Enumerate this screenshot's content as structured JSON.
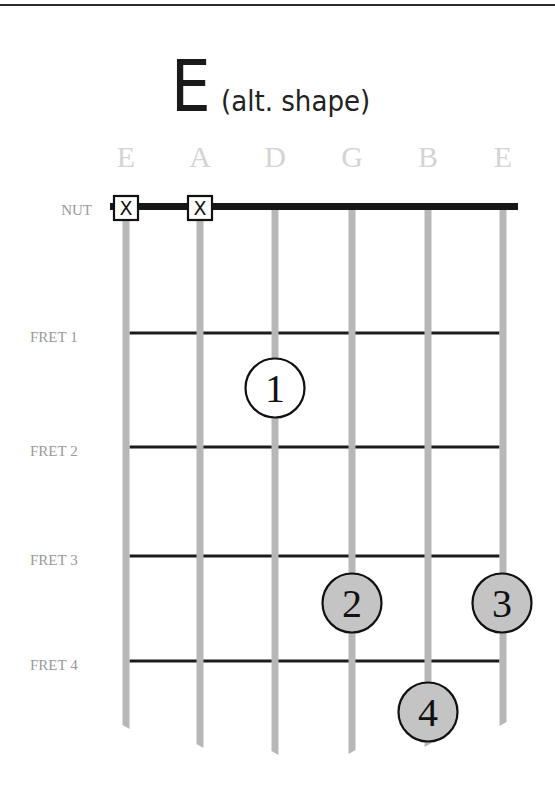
{
  "title": {
    "chord": "E",
    "variant": "(alt. shape)"
  },
  "nut_label": "NUT",
  "colors": {
    "string": "#b7b7b7",
    "fret": "#1c1c1c",
    "nut": "#161616",
    "string_label": "#d4d4d4",
    "fret_label": "#9a9a9a",
    "dot_open_fill": "#ffffff",
    "dot_filled_fill": "#c4c4c4",
    "dot_border": "#111111"
  },
  "strings": [
    {
      "name": "E",
      "x": 126,
      "end_y": 727,
      "muted": true
    },
    {
      "name": "A",
      "x": 200,
      "end_y": 746,
      "muted": true
    },
    {
      "name": "D",
      "x": 275,
      "end_y": 753,
      "muted": false
    },
    {
      "name": "G",
      "x": 352,
      "end_y": 752,
      "muted": false
    },
    {
      "name": "B",
      "x": 428,
      "end_y": 745,
      "muted": false
    },
    {
      "name": "E",
      "x": 503,
      "end_y": 724,
      "muted": false
    }
  ],
  "frets": [
    {
      "label": "FRET 1",
      "y": 333
    },
    {
      "label": "FRET 2",
      "y": 447
    },
    {
      "label": "FRET 3",
      "y": 556
    },
    {
      "label": "FRET 4",
      "y": 661
    }
  ],
  "muted_marker": "X",
  "fingers": [
    {
      "finger": "1",
      "string": 3,
      "fret": 1,
      "cx": 275,
      "cy": 388,
      "style": "open"
    },
    {
      "finger": "2",
      "string": 4,
      "fret": 3,
      "cx": 352,
      "cy": 603,
      "style": "filled"
    },
    {
      "finger": "3",
      "string": 6,
      "fret": 3,
      "cx": 502,
      "cy": 603,
      "style": "filled"
    },
    {
      "finger": "4",
      "string": 5,
      "fret": 4,
      "cx": 428,
      "cy": 712,
      "style": "filled"
    }
  ]
}
